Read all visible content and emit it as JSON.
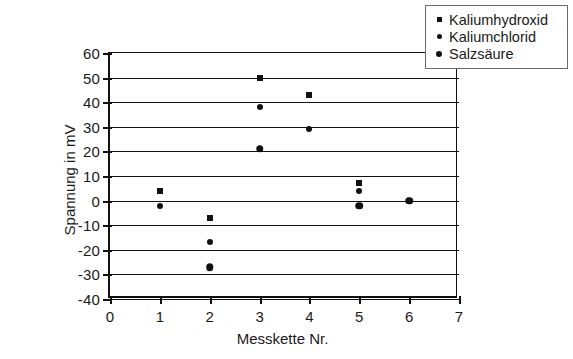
{
  "chart_data": {
    "type": "scatter",
    "title": "",
    "xlabel": "Messkette Nr.",
    "ylabel": "Spannung in mV",
    "xlim": [
      0,
      7
    ],
    "ylim": [
      -40,
      60
    ],
    "xticks": [
      "0",
      "1",
      "2",
      "3",
      "4",
      "5",
      "6",
      "7"
    ],
    "yticks": [
      "60",
      "50",
      "40",
      "30",
      "20",
      "10",
      "0",
      "-10",
      "-20",
      "-30",
      "-40"
    ],
    "grid": "horizontal",
    "legend_position": "top-right",
    "series": [
      {
        "name": "Kaliumhydroxid",
        "marker": "square",
        "color": "#111111",
        "points": [
          {
            "x": 1,
            "y": 4
          },
          {
            "x": 2,
            "y": -7
          },
          {
            "x": 3,
            "y": 50
          },
          {
            "x": 4,
            "y": 43
          },
          {
            "x": 5,
            "y": 7
          }
        ]
      },
      {
        "name": "Kaliumchlorid",
        "marker": "dot-small",
        "color": "#111111",
        "points": [
          {
            "x": 1,
            "y": -2
          },
          {
            "x": 2,
            "y": -17
          },
          {
            "x": 3,
            "y": 38
          },
          {
            "x": 4,
            "y": 29
          },
          {
            "x": 5,
            "y": 4
          }
        ]
      },
      {
        "name": "Salzsäure",
        "marker": "dot-large",
        "color": "#111111",
        "points": [
          {
            "x": 2,
            "y": -27
          },
          {
            "x": 3,
            "y": 21
          },
          {
            "x": 5,
            "y": -2
          },
          {
            "x": 6,
            "y": 0
          }
        ]
      }
    ]
  },
  "legend": {
    "items": [
      {
        "label": "Kaliumhydroxid",
        "marker": "square"
      },
      {
        "label": "Kaliumchlorid",
        "marker": "dot-small"
      },
      {
        "label": "Salzsäure",
        "marker": "dot-large"
      }
    ]
  }
}
